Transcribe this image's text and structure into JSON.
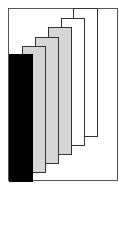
{
  "figure": {
    "frame": {
      "x": 8,
      "y": 8,
      "width": 110,
      "height": 173,
      "border_color": "#555555"
    },
    "panels": [
      {
        "id": "panel-6",
        "fill": "white",
        "x": 73,
        "y": 8,
        "width": 25,
        "height": 129
      },
      {
        "id": "panel-5",
        "fill": "white",
        "x": 61,
        "y": 18,
        "width": 24,
        "height": 128
      },
      {
        "id": "panel-4",
        "fill": "stipple",
        "x": 48,
        "y": 27,
        "width": 24,
        "height": 128
      },
      {
        "id": "panel-3",
        "fill": "stipple",
        "x": 35,
        "y": 37,
        "width": 24,
        "height": 127
      },
      {
        "id": "panel-2",
        "fill": "stipple",
        "x": 22,
        "y": 46,
        "width": 24,
        "height": 127
      },
      {
        "id": "panel-1",
        "fill": "black",
        "x": 9,
        "y": 54,
        "width": 24,
        "height": 128
      }
    ],
    "colors": {
      "black": "#000000",
      "stipple": "#d6d6d6",
      "white": "#ffffff",
      "outline": "#333333"
    }
  }
}
